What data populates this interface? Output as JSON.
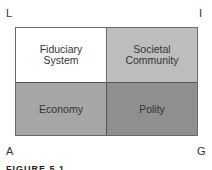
{
  "diagram": {
    "corners": {
      "top_left": "L",
      "top_right": "I",
      "bottom_left": "A",
      "bottom_right": "G"
    },
    "cells": [
      {
        "position": "top-left",
        "label": "Fiduciary\nSystem",
        "fill": "#ffffff"
      },
      {
        "position": "top-right",
        "label": "Societal\nCommunity",
        "fill": "#bdbdbd"
      },
      {
        "position": "bottom-left",
        "label": "Economy",
        "fill": "#a6a6a6"
      },
      {
        "position": "bottom-right",
        "label": "Polity",
        "fill": "#8f8f8f"
      }
    ],
    "caption": "FIGURE 5.1"
  }
}
